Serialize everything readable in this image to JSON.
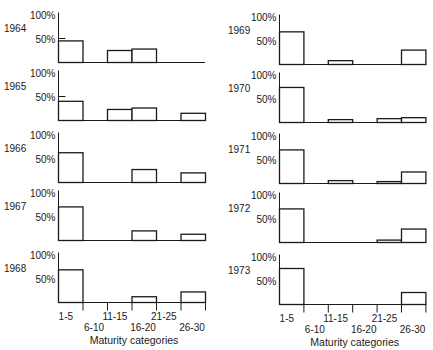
{
  "chart_data": {
    "type": "bar",
    "title": "",
    "xlabel": "Maturity categories",
    "ylabel": "",
    "ylim": [
      0,
      100
    ],
    "y_ticks": [
      "100%",
      "50%"
    ],
    "categories": [
      "1-5",
      "6-10",
      "11-15",
      "16-20",
      "21-25",
      "26-30"
    ],
    "grid": false,
    "legend": null,
    "layout": "small multiples, 2 columns x 5 rows, one histogram per year",
    "series": [
      {
        "name": "1964",
        "values": [
          45,
          0,
          25,
          28,
          0,
          0
        ]
      },
      {
        "name": "1965",
        "values": [
          40,
          0,
          23,
          26,
          0,
          15
        ]
      },
      {
        "name": "1966",
        "values": [
          62,
          0,
          0,
          27,
          0,
          20
        ]
      },
      {
        "name": "1967",
        "values": [
          70,
          0,
          0,
          20,
          0,
          13
        ]
      },
      {
        "name": "1968",
        "values": [
          68,
          0,
          0,
          12,
          0,
          22
        ]
      },
      {
        "name": "1969",
        "values": [
          68,
          0,
          8,
          0,
          0,
          30
        ]
      },
      {
        "name": "1970",
        "values": [
          73,
          0,
          6,
          0,
          8,
          10
        ]
      },
      {
        "name": "1971",
        "values": [
          70,
          0,
          6,
          0,
          4,
          24
        ]
      },
      {
        "name": "1972",
        "values": [
          70,
          0,
          0,
          0,
          5,
          28
        ]
      },
      {
        "name": "1973",
        "values": [
          75,
          0,
          0,
          0,
          0,
          25
        ]
      }
    ]
  },
  "panels": [
    {
      "year": "1964",
      "col": 0,
      "row": 0
    },
    {
      "year": "1965",
      "col": 0,
      "row": 1
    },
    {
      "year": "1966",
      "col": 0,
      "row": 2
    },
    {
      "year": "1967",
      "col": 0,
      "row": 3
    },
    {
      "year": "1968",
      "col": 0,
      "row": 4
    },
    {
      "year": "1969",
      "col": 1,
      "row": 0
    },
    {
      "year": "1970",
      "col": 1,
      "row": 1
    },
    {
      "year": "1971",
      "col": 1,
      "row": 2
    },
    {
      "year": "1972",
      "col": 1,
      "row": 3
    },
    {
      "year": "1973",
      "col": 1,
      "row": 4
    }
  ],
  "x_tick_labels_upper": [
    "1-5",
    "11-15",
    "21-25"
  ],
  "x_tick_labels_lower": [
    "6-10",
    "16-20",
    "26-30"
  ],
  "colors": {
    "ink": "#1a1a1a",
    "background": "#ffffff",
    "bar_fill": "#ffffff"
  }
}
